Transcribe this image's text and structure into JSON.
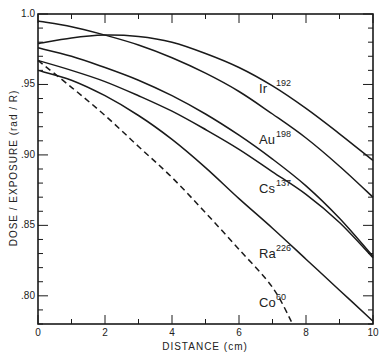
{
  "chart_data": {
    "type": "line",
    "title": "",
    "xlabel": "DISTANCE (cm)",
    "ylabel": "DOSE / EXPOSURE (rad / R)",
    "xlim": [
      0,
      10
    ],
    "ylim": [
      0.78,
      1.0
    ],
    "x_ticks": [
      0,
      2,
      4,
      6,
      8,
      10
    ],
    "x_tick_labels": [
      "0",
      "2",
      "4",
      "6",
      "8",
      "10"
    ],
    "y_ticks": [
      1.0,
      0.95,
      0.9,
      0.85,
      0.8
    ],
    "y_tick_labels": [
      "1.0",
      ".95",
      ".90",
      ".85",
      ".80"
    ],
    "grid": false,
    "legend": "inline labels",
    "series": [
      {
        "name": "Ir",
        "mass": "192",
        "style": "solid",
        "x": [
          0,
          1,
          2,
          3,
          4,
          5,
          6,
          7,
          8,
          9,
          10
        ],
        "values": [
          0.979,
          0.983,
          0.985,
          0.984,
          0.98,
          0.972,
          0.962,
          0.949,
          0.933,
          0.915,
          0.896
        ]
      },
      {
        "name": "Au",
        "mass": "198",
        "style": "solid",
        "x": [
          0,
          1,
          2,
          3,
          4,
          5,
          6,
          7,
          8,
          9,
          10
        ],
        "values": [
          0.995,
          0.991,
          0.985,
          0.978,
          0.969,
          0.958,
          0.945,
          0.929,
          0.912,
          0.892,
          0.87
        ]
      },
      {
        "name": "Cs",
        "mass": "137",
        "style": "solid",
        "x": [
          0,
          1,
          2,
          3,
          4,
          5,
          6,
          7,
          8,
          9,
          10
        ],
        "values": [
          0.976,
          0.97,
          0.962,
          0.953,
          0.942,
          0.929,
          0.914,
          0.897,
          0.878,
          0.855,
          0.828
        ]
      },
      {
        "name": "Ra",
        "mass": "226",
        "style": "solid",
        "x": [
          0,
          1,
          2,
          3,
          4,
          5,
          6,
          7,
          8,
          9,
          10
        ],
        "values": [
          0.967,
          0.96,
          0.952,
          0.942,
          0.931,
          0.918,
          0.904,
          0.888,
          0.872,
          0.852,
          0.827
        ]
      },
      {
        "name": "Co",
        "mass": "60",
        "style": "solid",
        "x": [
          0,
          1,
          2,
          3,
          4,
          5,
          6,
          7,
          8,
          9,
          10
        ],
        "values": [
          0.96,
          0.953,
          0.942,
          0.928,
          0.911,
          0.891,
          0.869,
          0.848,
          0.826,
          0.804,
          0.782
        ]
      },
      {
        "name": "",
        "mass": "",
        "style": "dashed",
        "x": [
          0,
          1,
          2,
          3,
          4,
          5,
          6,
          7,
          7.6
        ],
        "values": [
          0.967,
          0.948,
          0.928,
          0.906,
          0.884,
          0.859,
          0.833,
          0.806,
          0.78
        ]
      }
    ],
    "annotations": [
      {
        "text": "Ir",
        "sup": "192",
        "x": 6.6,
        "y": 0.944
      },
      {
        "text": "Au",
        "sup": "198",
        "x": 6.6,
        "y": 0.908
      },
      {
        "text": "Cs",
        "sup": "137",
        "x": 6.6,
        "y": 0.873
      },
      {
        "text": "Ra",
        "sup": "226",
        "x": 6.6,
        "y": 0.827
      },
      {
        "text": "Co",
        "sup": "60",
        "x": 6.6,
        "y": 0.792
      }
    ]
  }
}
